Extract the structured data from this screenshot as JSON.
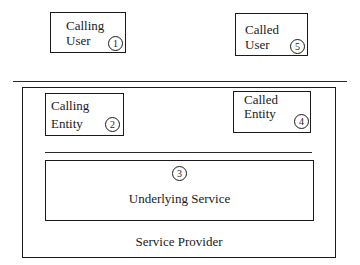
{
  "diagram": {
    "nodes": [
      {
        "id": "calling_user",
        "label": "Calling\nUser",
        "number": "1"
      },
      {
        "id": "called_user",
        "label": "Called\nUser",
        "number": "5"
      },
      {
        "id": "calling_entity",
        "label": "Calling\nEntity",
        "number": "2"
      },
      {
        "id": "called_entity",
        "label": "Called\nEntity",
        "number": "4"
      },
      {
        "id": "underlying_service",
        "label": "Underlying Service",
        "number": "3"
      }
    ],
    "container": {
      "label": "Service Provider"
    },
    "colors": {
      "stroke": "#1a1a1a",
      "background": "#ffffff"
    }
  }
}
